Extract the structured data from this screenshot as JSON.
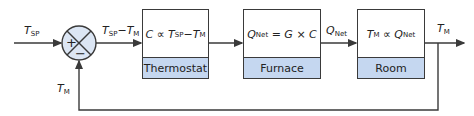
{
  "diagram": {
    "type": "closed-loop feedback control block diagram",
    "colors": {
      "line": "#3a3a3a",
      "label_band": "#c5d7f0",
      "junction_fill": "#dce6f4"
    },
    "input": {
      "symbol": "T",
      "sub": "SP"
    },
    "junction": {
      "plus": "+",
      "minus": "−"
    },
    "error_signal": {
      "a_sym": "T",
      "a_sub": "SP",
      "op": "−",
      "b_sym": "T",
      "b_sub": "M"
    },
    "blocks": [
      {
        "name": "Thermostat",
        "eq_lhs": "C",
        "eq_op": "∝",
        "eq_a_sym": "T",
        "eq_a_sub": "SP",
        "eq_minus": "−",
        "eq_b_sym": "T",
        "eq_b_sub": "M"
      },
      {
        "name": "Furnace",
        "eq_lhs_sym": "Q",
        "eq_lhs_sub": "Net",
        "eq_rest": "= G × C"
      },
      {
        "name": "Room",
        "eq_lhs_sym": "T",
        "eq_lhs_sub": "M",
        "eq_op": "∝",
        "eq_rhs_sym": "Q",
        "eq_rhs_sub": "Net"
      }
    ],
    "furnace_output": {
      "symbol": "Q",
      "sub": "Net"
    },
    "output": {
      "symbol": "T",
      "sub": "M"
    },
    "feedback": {
      "symbol": "T",
      "sub": "M"
    }
  }
}
